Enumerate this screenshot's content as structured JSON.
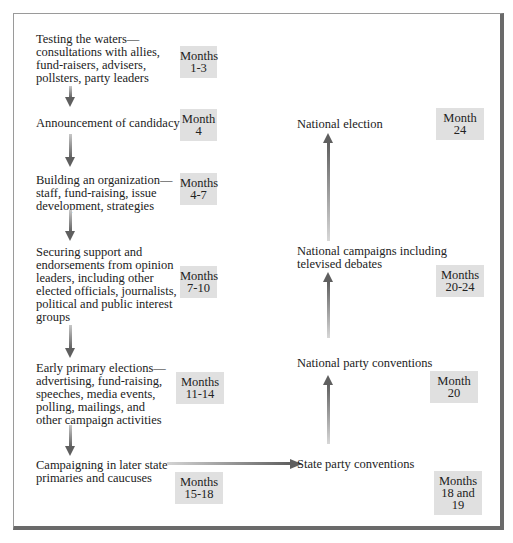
{
  "diagram": {
    "left_column": [
      {
        "text": "Testing the waters—\nconsultations with allies,\nfund-raisers, advisers,\npollsters, party leaders",
        "time": "Months\n1-3"
      },
      {
        "text": "Announcement of candidacy",
        "time": "Month\n4"
      },
      {
        "text": "Building an organization—\nstaff, fund-raising, issue\ndevelopment, strategies",
        "time": "Months\n4-7"
      },
      {
        "text": "Securing support and\nendorsements from opinion\nleaders, including other\nelected officials, journalists,\npolitical and public interest\ngroups",
        "time": "Months\n7-10"
      },
      {
        "text": "Early primary elections—\nadvertising, fund-raising,\nspeeches, media events,\npolling, mailings, and\nother campaign activities",
        "time": "Months\n11-14"
      },
      {
        "text": "Campaigning in later state\nprimaries and caucuses",
        "time": "Months\n15-18"
      }
    ],
    "right_column": [
      {
        "text": "State party conventions",
        "time": "Months\n18 and 19"
      },
      {
        "text": "National party conventions",
        "time": "Month\n20"
      },
      {
        "text": "National campaigns including\ntelevised debates",
        "time": "Months\n20-24"
      },
      {
        "text": "National election",
        "time": "Month\n24"
      }
    ],
    "colors": {
      "badge": "#e0e0e0",
      "arrow": "#5f5f5f",
      "frame": "#6a6a6a"
    }
  }
}
